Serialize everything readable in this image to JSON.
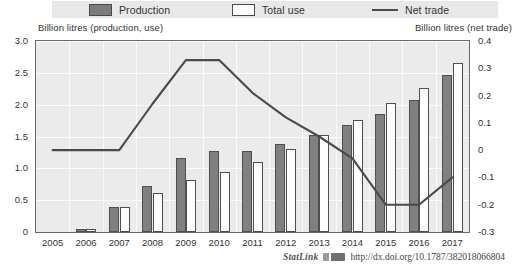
{
  "legend": {
    "items": [
      {
        "label": "Production",
        "icon": "filled-square-swatch-icon"
      },
      {
        "label": "Total use",
        "icon": "outlined-square-swatch-icon"
      },
      {
        "label": "Net trade",
        "icon": "line-swatch-icon"
      }
    ]
  },
  "axes": {
    "left_caption": "Billion litres (production, use)",
    "right_caption": "Billion litres (net trade)",
    "left_ticks": [
      "3.0",
      "2.5",
      "2.0",
      "1.5",
      "1.0",
      "0.5",
      "0"
    ],
    "right_ticks": [
      "0.4",
      "0.3",
      "0.2",
      "0.1",
      "0",
      "-0.1",
      "-0.2",
      "-0.3"
    ]
  },
  "source": {
    "statlink_label": "StatLink",
    "url": "http://dx.doi.org/10.1787/382018066804"
  },
  "colors": {
    "production_bar": "#808080",
    "total_use_bar": "#fdfdfd",
    "net_trade_line": "#4a4a4a",
    "plot_background": "#ebebeb",
    "legend_background": "#e8e8e8",
    "gridline": "#fbfbfb",
    "axis": "#6a6a6a"
  },
  "chart_data": {
    "type": "bar",
    "title": "",
    "xlabel": "",
    "ylabel": "Billion litres (production, use)",
    "y2label": "Billion litres (net trade)",
    "ylim": [
      0,
      3.0
    ],
    "y2lim": [
      -0.3,
      0.4
    ],
    "grid": true,
    "legend_position": "top",
    "categories": [
      "2005",
      "2006",
      "2007",
      "2008",
      "2009",
      "2010",
      "2011",
      "2012",
      "2013",
      "2014",
      "2015",
      "2016",
      "2017"
    ],
    "series": [
      {
        "name": "Production",
        "type": "bar",
        "axis": "left",
        "values": [
          0.0,
          0.04,
          0.4,
          0.73,
          1.16,
          1.27,
          1.28,
          1.38,
          1.53,
          1.68,
          1.86,
          2.07,
          2.47
        ]
      },
      {
        "name": "Total use",
        "type": "bar",
        "axis": "left",
        "values": [
          0.0,
          0.05,
          0.4,
          0.61,
          0.82,
          0.94,
          1.1,
          1.3,
          1.52,
          1.76,
          2.03,
          2.26,
          2.65
        ]
      },
      {
        "name": "Net trade",
        "type": "line",
        "axis": "right",
        "values": [
          0.0,
          0.0,
          0.0,
          0.17,
          0.33,
          0.33,
          0.21,
          0.12,
          0.05,
          -0.03,
          -0.2,
          -0.2,
          -0.1
        ]
      }
    ]
  }
}
